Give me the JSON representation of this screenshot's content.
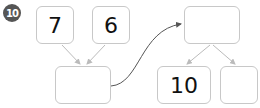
{
  "problem_number": "10",
  "boxes": {
    "top_left": "7",
    "top_middle": "6",
    "bottom_left": "",
    "top_right": "",
    "bottom_middle": "10",
    "bottom_right": ""
  },
  "colors": {
    "badge": "#555555",
    "box_border": "#c8c8c8",
    "arrow_light": "#bbbbbb",
    "arrow_dark": "#555555"
  }
}
